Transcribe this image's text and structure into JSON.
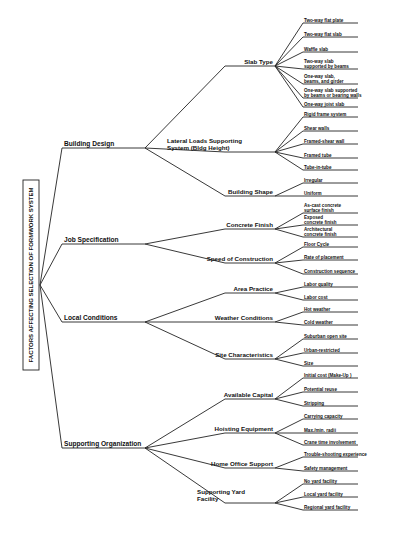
{
  "diagram": {
    "root": "FACTORS AFFECTING SELECTION OF FORMWORK SYSTEM",
    "categories": [
      {
        "label": "Building Design",
        "subfactors": [
          {
            "label": [
              "Slab Type"
            ],
            "items": [
              [
                "Two-way flat plate"
              ],
              [
                "Two-way flat slab"
              ],
              [
                "Waffle slab"
              ],
              [
                "Two-way slab",
                "supported by beams"
              ],
              [
                "One-way slab,",
                "beams, and girder"
              ],
              [
                "One-way slab supported",
                "by beams or bearing walls"
              ],
              [
                "One-way joist slab"
              ]
            ]
          },
          {
            "label": [
              "Lateral Loads Supporting",
              "System (Bldg Height)"
            ],
            "items": [
              [
                "Rigid frame system"
              ],
              [
                "Shear walls"
              ],
              [
                "Framed-shear wall"
              ],
              [
                "Framed tube"
              ],
              [
                "Tube-in-tube"
              ]
            ]
          },
          {
            "label": [
              "Building Shape"
            ],
            "items": [
              [
                "Irregular"
              ],
              [
                "Uniform"
              ]
            ]
          }
        ]
      },
      {
        "label": "Job Specification",
        "subfactors": [
          {
            "label": [
              "Concrete Finish"
            ],
            "items": [
              [
                "As-cast concrete",
                "surface finish"
              ],
              [
                "Exposed",
                "concrete finish"
              ],
              [
                "Architectural",
                "concrete finish"
              ]
            ]
          },
          {
            "label": [
              "Speed of Construction"
            ],
            "items": [
              [
                "Floor Cycle"
              ],
              [
                "Rate of placement"
              ],
              [
                "Construction sequence"
              ]
            ]
          }
        ]
      },
      {
        "label": "Local Conditions",
        "subfactors": [
          {
            "label": [
              "Area Practice"
            ],
            "items": [
              [
                "Labor quality"
              ],
              [
                "Labor cost"
              ]
            ]
          },
          {
            "label": [
              "Weather Conditions"
            ],
            "items": [
              [
                "Hot weather"
              ],
              [
                "Cold weather"
              ]
            ]
          },
          {
            "label": [
              "Site Characteristics"
            ],
            "items": [
              [
                "Suburban open site"
              ],
              [
                "Urban-restricted"
              ],
              [
                "Size"
              ]
            ]
          }
        ]
      },
      {
        "label": "Supporting Organization",
        "subfactors": [
          {
            "label": [
              "Available Capital"
            ],
            "items": [
              [
                "Initial cost (Make-Up )"
              ],
              [
                "Potential reuse"
              ],
              [
                "Stripping"
              ]
            ]
          },
          {
            "label": [
              "Hoisting Equipment"
            ],
            "items": [
              [
                "Carrying capacity"
              ],
              [
                "Max./min. radii"
              ],
              [
                "Crane time involvement"
              ]
            ]
          },
          {
            "label": [
              "Home Office Support"
            ],
            "items": [
              [
                "Trouble-shooting experience"
              ],
              [
                "Safety management"
              ]
            ]
          },
          {
            "label": [
              "Supporting Yard",
              "Facility"
            ],
            "items": [
              [
                "No yard facility"
              ],
              [
                "Local yard facility"
              ],
              [
                "Regional yard facility"
              ]
            ]
          }
        ]
      }
    ]
  },
  "layout": {
    "root_box": {
      "x": 23,
      "y": 180,
      "w": 16,
      "h": 190
    },
    "root_anchor": {
      "x": 40,
      "y": 285
    },
    "cat_line": {
      "x1": 62,
      "x2": 145
    },
    "sub_line": {
      "x1": 225,
      "x2": 275
    },
    "item_line": {
      "x1": 303,
      "x2": 358
    },
    "categories_y": [
      148,
      244,
      322,
      448
    ],
    "subs_y": [
      [
        66,
        152,
        196
      ],
      [
        229,
        263
      ],
      [
        293,
        322,
        359
      ],
      [
        399,
        433,
        468,
        503
      ]
    ],
    "items_y": [
      [
        [
          23,
          37,
          52,
          69,
          84,
          98,
          107
        ],
        [
          117,
          131,
          144,
          158,
          170
        ],
        [
          183,
          196
        ]
      ],
      [
        [
          213,
          225,
          237
        ],
        [
          247,
          260,
          274
        ]
      ],
      [
        [
          287,
          300
        ],
        [
          312,
          325
        ],
        [
          339,
          353,
          366
        ]
      ],
      [
        [
          378,
          392,
          406
        ],
        [
          419,
          433,
          445
        ],
        [
          457,
          471
        ],
        [
          484,
          497,
          510
        ]
      ]
    ]
  }
}
